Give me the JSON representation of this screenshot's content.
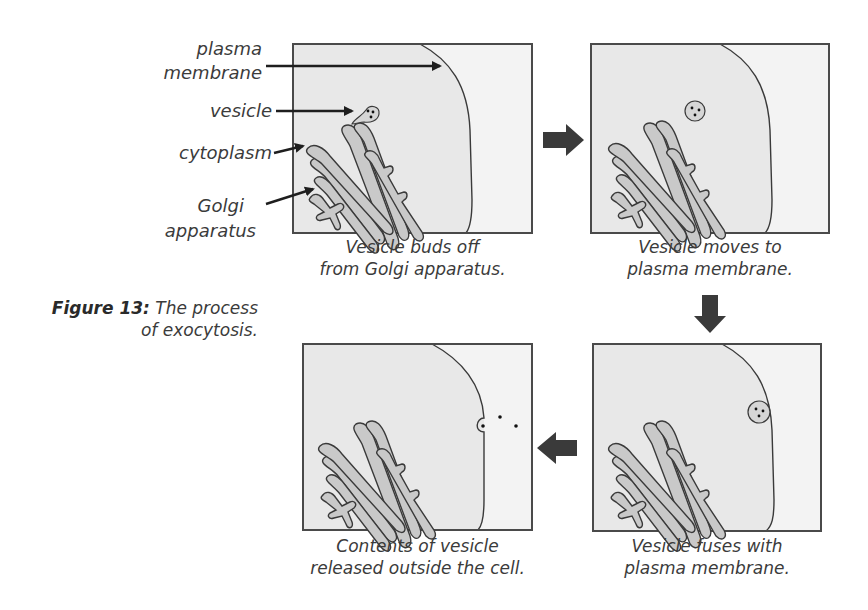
{
  "figure": {
    "number_label": "Figure 13:",
    "title_line1": "The process",
    "title_line2": "of exocytosis."
  },
  "labels": {
    "plasma": "plasma",
    "membrane": "membrane",
    "vesicle": "vesicle",
    "cytoplasm": "cytoplasm",
    "golgi": "Golgi",
    "apparatus": "apparatus"
  },
  "panels": [
    {
      "step": 1,
      "caption_line1": "Vesicle buds off",
      "caption_line2": "from Golgi apparatus."
    },
    {
      "step": 2,
      "caption_line1": "Vesicle moves to",
      "caption_line2": "plasma membrane."
    },
    {
      "step": 3,
      "caption_line1": "Vesicle fuses with",
      "caption_line2": "plasma membrane."
    },
    {
      "step": 4,
      "caption_line1": "Contents of vesicle",
      "caption_line2": "released outside the cell."
    }
  ],
  "arrows": [
    {
      "from": 1,
      "to": 2,
      "direction": "right"
    },
    {
      "from": 2,
      "to": 3,
      "direction": "down"
    },
    {
      "from": 3,
      "to": 4,
      "direction": "left"
    }
  ],
  "colors": {
    "cell_fill": "#e8e8e8",
    "outside_fill": "#f3f3f3",
    "golgi_fill": "#c9c9c9",
    "outline": "#3a3a3a",
    "arrow": "#3a3a3a",
    "text": "#3b3b3b"
  }
}
